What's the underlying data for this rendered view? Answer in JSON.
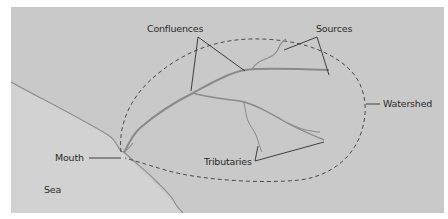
{
  "diagram": {
    "type": "river-system",
    "labels": {
      "confluences": "Confluences",
      "sources": "Sources",
      "watershed": "Watershed",
      "mouth": "Mouth",
      "tributaries": "Tributaries",
      "sea": "Sea"
    },
    "colors": {
      "land": "#c9c9c9",
      "sea": "#d3d3d3",
      "river": "#8a8a8a",
      "coastline": "#8e8e8e",
      "pointer": "#2f2f2f",
      "watershed_boundary": "#4a4a4a",
      "background": "#ffffff"
    }
  }
}
